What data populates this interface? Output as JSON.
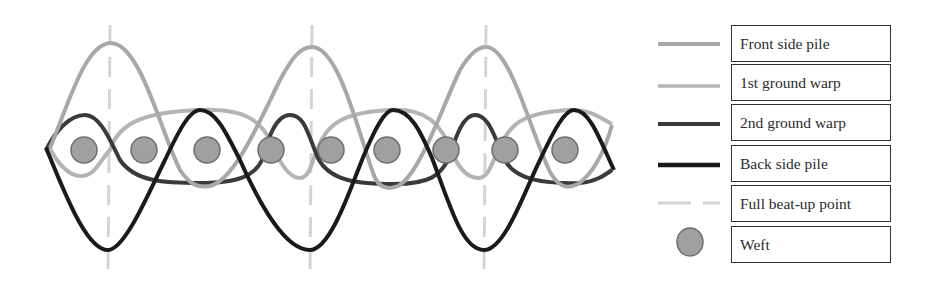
{
  "diagram": {
    "colors": {
      "front_side_pile": "#a8a8a8",
      "first_ground_warp": "#b4b4b4",
      "second_ground_warp": "#3a3a3a",
      "back_side_pile": "#1a1a1a",
      "beat_up_line": "#d4d4d4",
      "weft_fill": "#a0a0a0",
      "weft_stroke": "#6e6e6e"
    },
    "beat_up_points_x": [
      110,
      312,
      485
    ],
    "wefts": [
      {
        "x": 84,
        "y": 150
      },
      {
        "x": 144,
        "y": 150
      },
      {
        "x": 207,
        "y": 150
      },
      {
        "x": 271,
        "y": 150
      },
      {
        "x": 331,
        "y": 150
      },
      {
        "x": 387,
        "y": 150
      },
      {
        "x": 446,
        "y": 150
      },
      {
        "x": 505,
        "y": 150
      },
      {
        "x": 565,
        "y": 150
      }
    ]
  },
  "legend": {
    "items": [
      {
        "label": "Front side pile",
        "swatch": "line-light"
      },
      {
        "label": "1st ground warp",
        "swatch": "line-light-thin"
      },
      {
        "label": "2nd ground warp",
        "swatch": "line-dark"
      },
      {
        "label": "Back side pile",
        "swatch": "line-black"
      },
      {
        "label": "Full beat-up point",
        "swatch": "dashed-line"
      },
      {
        "label": "Weft",
        "swatch": "circle"
      }
    ]
  }
}
